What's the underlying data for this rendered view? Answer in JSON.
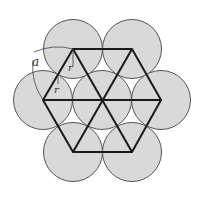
{
  "diagram": {
    "type": "hexagonal circle packing",
    "center": [
      102,
      100
    ],
    "hex_radius": 59,
    "circle_radius": 29.5,
    "colors": {
      "circle_fill": "#d9d9d9",
      "circle_stroke": "#555555",
      "line": "#1a1a1a",
      "annotation": "#444444",
      "background": "#ffffff"
    },
    "labels": {
      "a": "a",
      "r_upper": "r",
      "r_lower": "r"
    }
  }
}
